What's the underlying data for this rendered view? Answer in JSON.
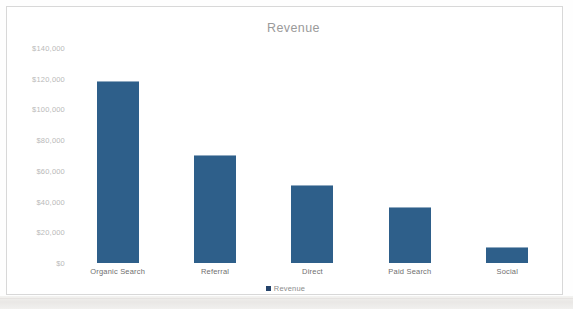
{
  "chart_data": {
    "type": "bar",
    "title": "Revenue",
    "xlabel": "",
    "ylabel": "",
    "categories": [
      "Organic Search",
      "Referral",
      "Direct",
      "Paid Search",
      "Social"
    ],
    "values": [
      118000,
      70000,
      50000,
      36000,
      10000
    ],
    "series": [
      {
        "name": "Revenue",
        "values": [
          118000,
          70000,
          50000,
          36000,
          10000
        ]
      }
    ],
    "ylim": [
      0,
      140000
    ],
    "y_ticks": [
      {
        "value": 140000,
        "label": "$140,000"
      },
      {
        "value": 120000,
        "label": "$120,000"
      },
      {
        "value": 100000,
        "label": "$100,000"
      },
      {
        "value": 80000,
        "label": "$80,000"
      },
      {
        "value": 60000,
        "label": "$60,000"
      },
      {
        "value": 40000,
        "label": "$40,000"
      },
      {
        "value": 20000,
        "label": "$20,000"
      },
      {
        "value": 0,
        "label": "$0"
      }
    ],
    "grid": false,
    "legend_position": "bottom",
    "legend_entries": [
      "Revenue"
    ],
    "colors": {
      "bar": "#2E5F8A",
      "legend_marker": "#24436A",
      "title_text": "#9A9A9A",
      "axis_text": "#B9B9B9",
      "category_text": "#6F6F6F",
      "frame_border": "#D8D8D8",
      "background": "#FFFFFF"
    }
  }
}
